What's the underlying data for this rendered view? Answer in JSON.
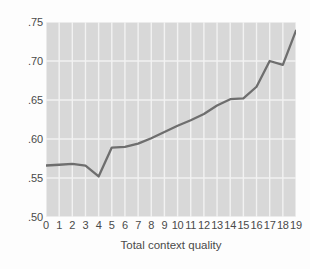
{
  "chart_data": {
    "type": "line",
    "title": "",
    "xlabel": "Total context quality",
    "ylabel": "Eighth-grade success",
    "x": [
      0,
      1,
      2,
      3,
      4,
      5,
      6,
      7,
      8,
      9,
      10,
      11,
      12,
      13,
      14,
      15,
      16,
      17,
      18,
      19
    ],
    "values": [
      0.566,
      0.567,
      0.568,
      0.566,
      0.552,
      0.589,
      0.59,
      0.594,
      0.601,
      0.609,
      0.617,
      0.624,
      0.632,
      0.643,
      0.651,
      0.652,
      0.667,
      0.7,
      0.695,
      0.739
    ],
    "series": [
      {
        "name": "Eighth-grade success",
        "values": [
          0.566,
          0.567,
          0.568,
          0.566,
          0.552,
          0.589,
          0.59,
          0.594,
          0.601,
          0.609,
          0.617,
          0.624,
          0.632,
          0.643,
          0.651,
          0.652,
          0.667,
          0.7,
          0.695,
          0.739
        ]
      }
    ],
    "xlim": [
      0,
      19
    ],
    "ylim": [
      0.5,
      0.75
    ],
    "xticks": [
      0,
      1,
      2,
      3,
      4,
      5,
      6,
      7,
      8,
      9,
      10,
      11,
      12,
      13,
      14,
      15,
      16,
      17,
      18,
      19
    ],
    "xtick_labels": [
      "0",
      "1",
      "2",
      "3",
      "4",
      "5",
      "6",
      "7",
      "8",
      "9",
      "10",
      "11",
      "12",
      "13",
      "14",
      "15",
      "16",
      "17",
      "18",
      "19"
    ],
    "yticks": [
      0.5,
      0.55,
      0.6,
      0.65,
      0.7,
      0.75
    ],
    "ytick_labels": [
      ".50",
      ".55",
      ".60",
      ".65",
      ".70",
      ".75"
    ],
    "grid": true,
    "grid_axes": "both",
    "legend": false,
    "legend_position": "none",
    "line_color": "#6e6e6e",
    "line_width": 2.3,
    "grid_color": "#f2f2f2",
    "plot_background": "#d8d8d8",
    "figure_background": "#fdfdfd",
    "text_color": "#4a4a4a",
    "markers": false
  }
}
